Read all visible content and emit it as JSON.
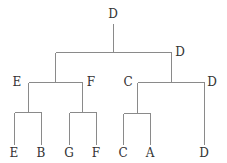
{
  "diagram": {
    "type": "dendrogram",
    "line_color": "#8a8a8a",
    "text_color": "#333333",
    "nodes": [
      {
        "id": "root",
        "label": "D",
        "x": 113,
        "y": 18
      },
      {
        "id": "n1",
        "label": "D",
        "x": 180,
        "y": 56
      },
      {
        "id": "n2",
        "label": "E",
        "x": 17,
        "y": 86
      },
      {
        "id": "n3",
        "label": "F",
        "x": 91,
        "y": 86
      },
      {
        "id": "n4",
        "label": "C",
        "x": 128,
        "y": 86
      },
      {
        "id": "n5",
        "label": "D",
        "x": 212,
        "y": 86
      },
      {
        "id": "leaf1",
        "label": "E",
        "x": 14,
        "y": 157
      },
      {
        "id": "leaf2",
        "label": "B",
        "x": 41,
        "y": 157
      },
      {
        "id": "leaf3",
        "label": "G",
        "x": 69,
        "y": 157
      },
      {
        "id": "leaf4",
        "label": "F",
        "x": 96,
        "y": 157
      },
      {
        "id": "leaf5",
        "label": "C",
        "x": 123,
        "y": 157
      },
      {
        "id": "leaf6",
        "label": "A",
        "x": 150,
        "y": 157
      },
      {
        "id": "leaf7",
        "label": "D",
        "x": 204,
        "y": 157
      }
    ],
    "edges": [
      [
        113,
        23,
        113,
        52
      ],
      [
        55,
        52,
        171,
        52
      ],
      [
        55,
        52,
        55,
        82
      ],
      [
        171,
        52,
        171,
        82
      ],
      [
        28,
        82,
        82,
        82
      ],
      [
        137,
        82,
        204,
        82
      ],
      [
        28,
        82,
        28,
        112
      ],
      [
        82,
        82,
        82,
        112
      ],
      [
        14,
        112,
        41,
        112
      ],
      [
        69,
        112,
        96,
        112
      ],
      [
        14,
        112,
        14,
        144
      ],
      [
        41,
        112,
        41,
        144
      ],
      [
        69,
        112,
        69,
        144
      ],
      [
        96,
        112,
        96,
        144
      ],
      [
        137,
        82,
        137,
        113
      ],
      [
        123,
        113,
        150,
        113
      ],
      [
        123,
        113,
        123,
        144
      ],
      [
        150,
        113,
        150,
        144
      ],
      [
        204,
        82,
        204,
        144
      ]
    ]
  }
}
